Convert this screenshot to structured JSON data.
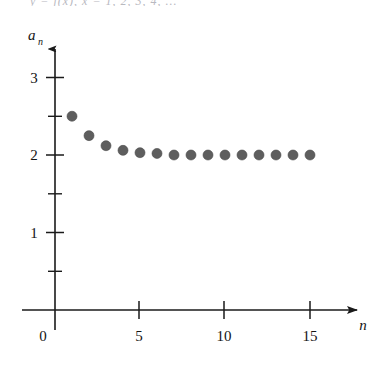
{
  "figure": {
    "top_cutoff_text": "y = f(x), x = 1, 2, 3, 4, ...",
    "background_color": "#ffffff",
    "point_color": "#5e5e5e",
    "axis_color": "#1a1a1a"
  },
  "chart_data": {
    "type": "scatter",
    "title": "",
    "subtitle": "",
    "xlabel": "n",
    "ylabel": "a_n",
    "x": [
      1,
      2,
      3,
      4,
      5,
      6,
      7,
      8,
      9,
      10,
      11,
      12,
      13,
      14,
      15
    ],
    "values": [
      2.5,
      2.25,
      2.12,
      2.06,
      2.03,
      2.02,
      2.0,
      2.0,
      2.0,
      2.0,
      2.0,
      2.0,
      2.0,
      2.0,
      2.0
    ],
    "series": [
      {
        "name": "a_n",
        "values": [
          2.5,
          2.25,
          2.12,
          2.06,
          2.03,
          2.02,
          2.0,
          2.0,
          2.0,
          2.0,
          2.0,
          2.0,
          2.0,
          2.0,
          2.0
        ]
      }
    ],
    "xlim": [
      -0.6,
      19.2
    ],
    "ylim": [
      -0.55,
      3.45
    ],
    "x_ticks_major": [
      0,
      5,
      10,
      15
    ],
    "x_tick_labels": [
      "0",
      "5",
      "10",
      "15"
    ],
    "y_ticks_major": [
      1,
      2,
      3
    ],
    "y_tick_labels": [
      "1",
      "2",
      "3"
    ],
    "y_ticks_minor": [
      0.5,
      1.5,
      2.5
    ],
    "grid": false,
    "legend": false,
    "legend_position": "none",
    "x_axis_arrow": true,
    "y_axis_arrow": true,
    "marker": "filled-circle",
    "marker_radius_px": 5,
    "annotations": []
  },
  "labels": {
    "y_axis_main": "a",
    "y_axis_subscript": "n",
    "x_axis_main": "n",
    "origin_label": "0"
  }
}
